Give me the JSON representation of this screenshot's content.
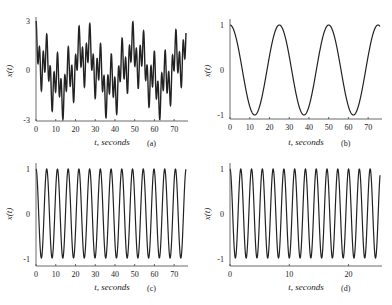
{
  "figure": {
    "panels": [
      {
        "id": "a",
        "label": "(a)",
        "xlabel": "t, seconds",
        "ylabel": "x(t)",
        "yticks": [
          "3",
          "0",
          "-3"
        ],
        "xticks": [
          "0",
          "10",
          "20",
          "30",
          "40",
          "50",
          "60",
          "70"
        ]
      },
      {
        "id": "b",
        "label": "(b)",
        "xlabel": "t, seconds",
        "ylabel": "x(t)",
        "yticks": [
          "1",
          "0",
          "-1"
        ],
        "xticks": [
          "0",
          "10",
          "20",
          "30",
          "40",
          "50",
          "60",
          "70"
        ]
      },
      {
        "id": "c",
        "label": "(c)",
        "xlabel": "t, seconds",
        "ylabel": "x(t)",
        "yticks": [
          "1",
          "0",
          "-1"
        ],
        "xticks": [
          "0",
          "10",
          "20",
          "30",
          "40",
          "50",
          "60",
          "70"
        ]
      },
      {
        "id": "d",
        "label": "(d)",
        "xlabel": "t, seconds",
        "ylabel": "x(t)",
        "yticks": [
          "1",
          "0",
          "-1"
        ],
        "xticks": [
          "0",
          "10",
          "20"
        ]
      }
    ]
  },
  "chart_data": [
    {
      "type": "line",
      "panel": "(a)",
      "title": "",
      "xlabel": "t, seconds",
      "ylabel": "x(t)",
      "xlim": [
        0,
        76
      ],
      "ylim": [
        -3,
        3
      ],
      "xticks": [
        0,
        10,
        20,
        30,
        40,
        50,
        60,
        70
      ],
      "yticks": [
        -3,
        0,
        3
      ],
      "grid": false,
      "series": [
        {
          "name": "x(t) = cos(2π·0.04t) + cos(2π·0.184t) + cos(2π·0.55t)",
          "formula": "sum",
          "components_hz": [
            0.04,
            0.184,
            0.55
          ]
        }
      ]
    },
    {
      "type": "line",
      "panel": "(b)",
      "title": "",
      "xlabel": "t, seconds",
      "ylabel": "x(t)",
      "xlim": [
        0,
        76
      ],
      "ylim": [
        -1,
        1
      ],
      "xticks": [
        0,
        10,
        20,
        30,
        40,
        50,
        60,
        70
      ],
      "yticks": [
        -1,
        0,
        1
      ],
      "grid": false,
      "series": [
        {
          "name": "x(t) = cos(2π·0.04t)",
          "freq_hz": 0.04,
          "amplitude": 1
        }
      ]
    },
    {
      "type": "line",
      "panel": "(c)",
      "title": "",
      "xlabel": "t, seconds",
      "ylabel": "x(t)",
      "xlim": [
        0,
        76
      ],
      "ylim": [
        -1,
        1
      ],
      "xticks": [
        0,
        10,
        20,
        30,
        40,
        50,
        60,
        70
      ],
      "yticks": [
        -1,
        0,
        1
      ],
      "grid": false,
      "series": [
        {
          "name": "x(t) = cos(2π·0.184t)",
          "freq_hz": 0.184,
          "amplitude": 1
        }
      ]
    },
    {
      "type": "line",
      "panel": "(d)",
      "title": "",
      "xlabel": "t, seconds",
      "ylabel": "x(t)",
      "xlim": [
        0,
        25.3
      ],
      "ylim": [
        -1,
        1
      ],
      "xticks": [
        0,
        10,
        20
      ],
      "yticks": [
        -1,
        0,
        1
      ],
      "grid": false,
      "series": [
        {
          "name": "x(t) = cos(2π·0.55t)",
          "freq_hz": 0.55,
          "amplitude": 1
        }
      ]
    }
  ]
}
